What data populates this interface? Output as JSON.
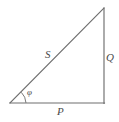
{
  "figure": {
    "type": "geometry-diagram",
    "background_color": "#ffffff",
    "line_color": "#6e6e6e",
    "label_color": "#4a4a4a"
  },
  "labels": {
    "hypotenuse": "S",
    "vertical_leg": "Q",
    "horizontal_leg": "P",
    "angle": "φ"
  },
  "geometry": {
    "vertices": {
      "left": [
        10,
        103
      ],
      "bottom_right": [
        104,
        103
      ],
      "top_right": [
        104,
        8
      ]
    },
    "sides": [
      {
        "name": "horizontal-leg",
        "label": "P",
        "from": [
          10,
          103
        ],
        "to": [
          104,
          103
        ]
      },
      {
        "name": "vertical-leg",
        "label": "Q",
        "from": [
          104,
          103
        ],
        "to": [
          104,
          8
        ]
      },
      {
        "name": "hypotenuse",
        "label": "S",
        "from": [
          10,
          103
        ],
        "to": [
          104,
          8
        ]
      }
    ],
    "angle_marker": {
      "at_vertex": "left",
      "label": "φ",
      "radius": 16,
      "path": "M 26 103 A 16 16 0 0 0 21.5 92.6"
    }
  }
}
